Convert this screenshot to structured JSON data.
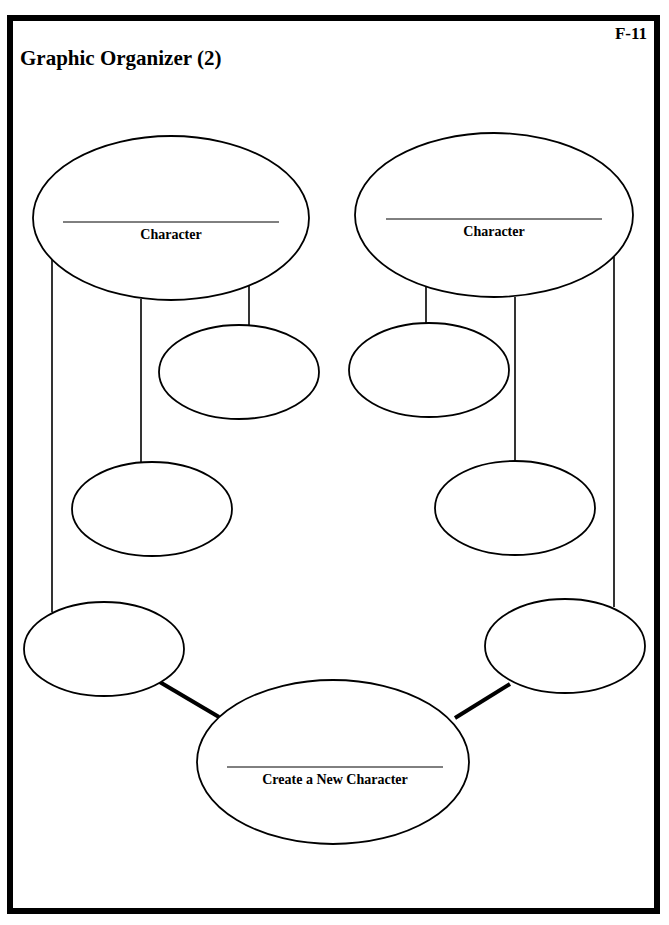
{
  "page": {
    "sheet_id": "F-11",
    "title": "Graphic Organizer (2)"
  },
  "diagram": {
    "character_left": {
      "label": "Character"
    },
    "character_right": {
      "label": "Character"
    },
    "new_character": {
      "label": "Create a New Character"
    },
    "blank_trait_ovals": 6,
    "colors": {
      "stroke": "#000000",
      "background": "#ffffff"
    }
  }
}
